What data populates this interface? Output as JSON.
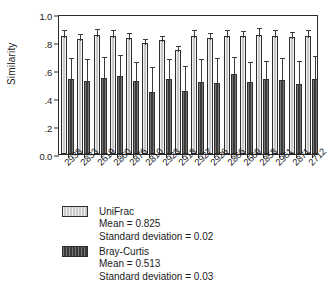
{
  "chart_data": {
    "type": "bar",
    "title": "",
    "subtitle": "",
    "xlabel": "",
    "ylabel": "Similarity",
    "ylim": [
      0.0,
      1.0
    ],
    "ytick_labels": [
      "1.0",
      ".8",
      ".6",
      ".4",
      ".2",
      "0.0"
    ],
    "ytick_values": [
      1.0,
      0.8,
      0.6,
      0.4,
      0.2,
      0.0
    ],
    "grid": false,
    "legend_position": "below-plot",
    "error_bars": "standard deviation (upper whisker shown)",
    "categories": [
      "2938",
      "2833",
      "2619",
      "2860",
      "2876",
      "2810",
      "2923",
      "2918",
      "2927",
      "2926",
      "2866",
      "2669",
      "2858",
      "2961",
      "2871",
      "2712"
    ],
    "series": [
      {
        "name": "UniFrac",
        "color": "#c9c9c9",
        "values": [
          0.845,
          0.822,
          0.85,
          0.84,
          0.83,
          0.79,
          0.812,
          0.745,
          0.843,
          0.826,
          0.845,
          0.84,
          0.851,
          0.844,
          0.833,
          0.845
        ],
        "errors": [
          0.057,
          0.05,
          0.057,
          0.057,
          0.052,
          0.045,
          0.048,
          0.043,
          0.058,
          0.052,
          0.057,
          0.056,
          0.06,
          0.056,
          0.05,
          0.058
        ]
      },
      {
        "name": "Bray-Curtis",
        "color": "#3a3a3a",
        "values": [
          0.535,
          0.52,
          0.543,
          0.56,
          0.523,
          0.445,
          0.538,
          0.452,
          0.515,
          0.506,
          0.57,
          0.515,
          0.533,
          0.527,
          0.502,
          0.535
        ],
        "errors": [
          0.168,
          0.175,
          0.162,
          0.165,
          0.15,
          0.193,
          0.152,
          0.193,
          0.175,
          0.192,
          0.136,
          0.16,
          0.146,
          0.17,
          0.18,
          0.18
        ]
      }
    ],
    "legend": [
      {
        "label": "UniFrac",
        "mean_line": "Mean = 0.825",
        "sd_line": "Standard deviation = 0.02",
        "mean": 0.825,
        "sd": 0.02
      },
      {
        "label": "Bray-Curtis",
        "mean_line": "Mean = 0.513",
        "sd_line": "Standard deviation = 0.03",
        "mean": 0.513,
        "sd": 0.03
      }
    ]
  }
}
